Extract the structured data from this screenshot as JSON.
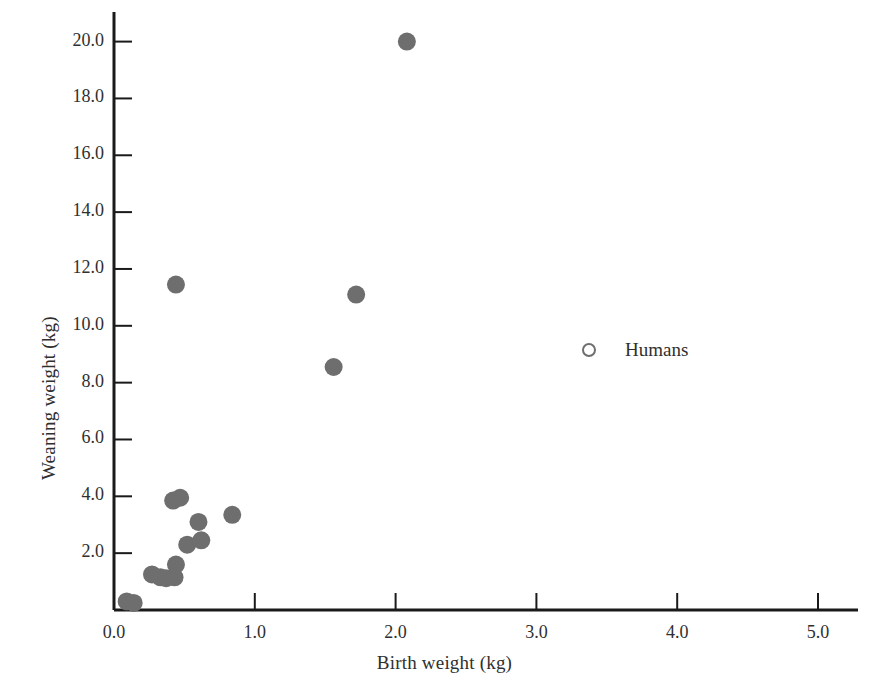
{
  "chart_data": {
    "type": "scatter",
    "title": "",
    "xlabel": "Birth weight (kg)",
    "ylabel": "Weaning weight (kg)",
    "xlim": [
      0.0,
      5.3
    ],
    "ylim": [
      0.0,
      20.8
    ],
    "xticks": [
      "0.0",
      "1.0",
      "2.0",
      "3.0",
      "4.0",
      "5.0"
    ],
    "xtick_values": [
      0.0,
      1.0,
      2.0,
      3.0,
      4.0,
      5.0
    ],
    "yticks": [
      "2.0",
      "4.0",
      "6.0",
      "8.0",
      "10.0",
      "12.0",
      "14.0",
      "16.0",
      "18.0",
      "20.0"
    ],
    "ytick_values": [
      2.0,
      4.0,
      6.0,
      8.0,
      10.0,
      12.0,
      14.0,
      16.0,
      18.0,
      20.0
    ],
    "grid": false,
    "legend_position": "inside-right",
    "series": [
      {
        "name": "Primates",
        "marker": "filled-circle",
        "color": "#6e6e6e",
        "points": [
          {
            "x": 2.08,
            "y": 20.0
          },
          {
            "x": 0.44,
            "y": 11.45
          },
          {
            "x": 1.72,
            "y": 11.1
          },
          {
            "x": 1.56,
            "y": 8.55
          },
          {
            "x": 0.42,
            "y": 3.85
          },
          {
            "x": 0.47,
            "y": 3.95
          },
          {
            "x": 0.6,
            "y": 3.1
          },
          {
            "x": 0.84,
            "y": 3.35
          },
          {
            "x": 0.52,
            "y": 2.3
          },
          {
            "x": 0.62,
            "y": 2.45
          },
          {
            "x": 0.44,
            "y": 1.6
          },
          {
            "x": 0.43,
            "y": 1.15
          },
          {
            "x": 0.27,
            "y": 1.25
          },
          {
            "x": 0.33,
            "y": 1.15
          },
          {
            "x": 0.37,
            "y": 1.12
          },
          {
            "x": 0.09,
            "y": 0.3
          },
          {
            "x": 0.14,
            "y": 0.25
          }
        ]
      },
      {
        "name": "Humans",
        "marker": "open-circle",
        "color": "#6e6e6e",
        "points": []
      }
    ],
    "legend": [
      {
        "label": "Humans",
        "marker": "open-circle",
        "color": "#6e6e6e"
      }
    ],
    "axis_color": "#1a1a1a"
  }
}
